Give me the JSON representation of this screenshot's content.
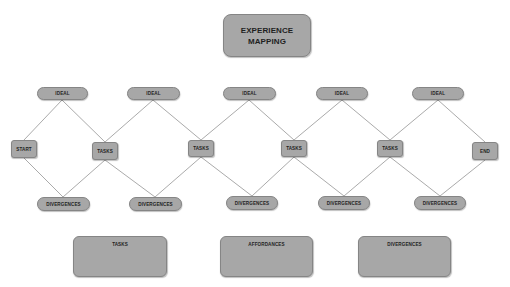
{
  "title": {
    "line1": "EXPERIENCE",
    "line2": "MAPPING"
  },
  "colors": {
    "node_fill": "#a7a7a7",
    "node_border": "#858585",
    "connector": "#a0a0a0",
    "text": "#1f1f1f"
  },
  "top_row": [
    {
      "label": "IDEAL"
    },
    {
      "label": "IDEAL"
    },
    {
      "label": "IDEAL"
    },
    {
      "label": "IDEAL"
    },
    {
      "label": "IDEAL"
    }
  ],
  "middle_row": [
    {
      "label": "START"
    },
    {
      "label": "TASKS"
    },
    {
      "label": "TASKS"
    },
    {
      "label": "TASKS"
    },
    {
      "label": "TASKS"
    },
    {
      "label": "END"
    }
  ],
  "bottom_row": [
    {
      "label": "DIVERGENCES"
    },
    {
      "label": "DIVERGENCES"
    },
    {
      "label": "DIVERGENCES"
    },
    {
      "label": "DIVERGENCES"
    },
    {
      "label": "DIVERGENCES"
    }
  ],
  "panels": [
    {
      "label": "TASKS"
    },
    {
      "label": "AFFORDANCES"
    },
    {
      "label": "DIVERGENCES"
    }
  ]
}
